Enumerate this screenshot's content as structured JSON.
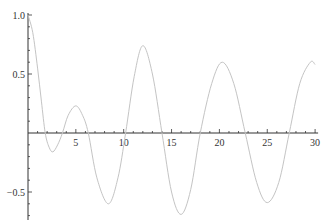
{
  "chart_data": {
    "type": "line",
    "title": "",
    "xlabel": "",
    "ylabel": "",
    "xlim": [
      0,
      30
    ],
    "ylim": [
      -0.7,
      1.0
    ],
    "grid": false,
    "legend": null,
    "x_ticks": [
      5,
      10,
      15,
      20,
      25,
      30
    ],
    "x_tick_labels": [
      "5",
      "10",
      "15",
      "20",
      "25",
      "30"
    ],
    "y_ticks": [
      1.0,
      0.5,
      -0.5
    ],
    "y_tick_labels": [
      "1.0",
      "0.5",
      "-0.5"
    ],
    "axes_origin": [
      0,
      0
    ],
    "series": [
      {
        "name": "curve",
        "color": "#c4c4c4",
        "x": [
          0,
          0.5,
          1,
          1.4,
          1.8,
          2.2,
          2.6,
          3.1,
          3.6,
          4.2,
          5,
          5.7,
          6.3,
          7.2,
          8.4,
          9.4,
          10.2,
          11.1,
          12,
          13,
          14,
          15,
          16,
          17,
          18,
          19.2,
          20.3,
          21.5,
          22.7,
          23.9,
          25,
          26.2,
          27.3,
          28.4,
          29.5,
          30
        ],
        "y": [
          1.0,
          0.85,
          0.55,
          0.27,
          0.0,
          -0.12,
          -0.16,
          -0.1,
          0.0,
          0.15,
          0.23,
          0.15,
          0.0,
          -0.38,
          -0.6,
          -0.38,
          0.0,
          0.48,
          0.74,
          0.5,
          0.0,
          -0.5,
          -0.69,
          -0.48,
          0.0,
          0.42,
          0.6,
          0.42,
          0.0,
          -0.42,
          -0.59,
          -0.42,
          0.0,
          0.42,
          0.6,
          0.58
        ]
      }
    ]
  },
  "layout": {
    "axis_color": "#333333",
    "origin_px": [
      28,
      133
    ],
    "x_px_per_unit": 9.57,
    "y_px_per_unit": 118
  }
}
